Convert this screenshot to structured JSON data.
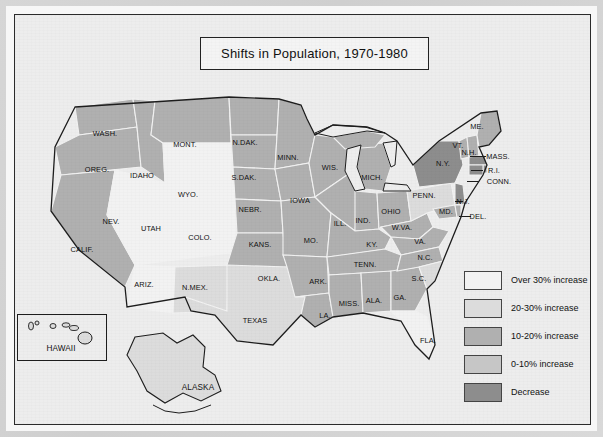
{
  "title": "Shifts in Population, 1970-1980",
  "legend": {
    "items": [
      {
        "label": "Over 30% increase",
        "color": "#f2f2f2"
      },
      {
        "label": "20-30% increase",
        "color": "#dcdcdc"
      },
      {
        "label": "10-20% increase",
        "color": "#b0b0b0"
      },
      {
        "label": "0-10% increase",
        "color": "#c6c6c6"
      },
      {
        "label": "Decrease",
        "color": "#8d8d8d"
      }
    ]
  },
  "insets": [
    {
      "name": "hawaii",
      "label": "HAWAII"
    },
    {
      "name": "alaska",
      "label": "ALASKA"
    }
  ],
  "states": [
    {
      "code": "WASH.",
      "label": "WASH.",
      "x": 90,
      "y": 118,
      "category": "10-20% increase"
    },
    {
      "code": "OREG.",
      "label": "OREG.",
      "x": 82,
      "y": 154,
      "category": "10-20% increase"
    },
    {
      "code": "IDAHO",
      "label": "IDAHO",
      "x": 127,
      "y": 160,
      "category": "10-20% increase"
    },
    {
      "code": "MONT.",
      "label": "MONT.",
      "x": 170,
      "y": 129,
      "category": "10-20% increase"
    },
    {
      "code": "WYO.",
      "label": "WYO.",
      "x": 173,
      "y": 179,
      "category": "Over 30% increase"
    },
    {
      "code": "NEV.",
      "label": "NEV.",
      "x": 96,
      "y": 206,
      "category": "Over 30% increase"
    },
    {
      "code": "UTAH",
      "label": "UTAH",
      "x": 136,
      "y": 213,
      "category": "Over 30% increase"
    },
    {
      "code": "COLO.",
      "label": "COLO.",
      "x": 185,
      "y": 222,
      "category": "Over 30% increase"
    },
    {
      "code": "CALIF.",
      "label": "CALIF.",
      "x": 67,
      "y": 234,
      "category": "10-20% increase"
    },
    {
      "code": "ARIZ.",
      "label": "ARIZ.",
      "x": 129,
      "y": 269,
      "category": "Over 30% increase"
    },
    {
      "code": "N.MEX.",
      "label": "N.MEX.",
      "x": 180,
      "y": 272,
      "category": "20-30% increase"
    },
    {
      "code": "N.DAK.",
      "label": "N.DAK.",
      "x": 230,
      "y": 127,
      "category": "0-10% increase"
    },
    {
      "code": "S.DAK.",
      "label": "S.DAK.",
      "x": 229,
      "y": 162,
      "category": "0-10% increase"
    },
    {
      "code": "NEBR.",
      "label": "NEBR.",
      "x": 235,
      "y": 194,
      "category": "0-10% increase"
    },
    {
      "code": "KANS.",
      "label": "KANS.",
      "x": 245,
      "y": 229,
      "category": "0-10% increase"
    },
    {
      "code": "OKLA.",
      "label": "OKLA.",
      "x": 254,
      "y": 263,
      "category": "10-20% increase"
    },
    {
      "code": "TEXAS",
      "label": "TEXAS",
      "x": 240,
      "y": 305,
      "category": "20-30% increase"
    },
    {
      "code": "MINN.",
      "label": "MINN.",
      "x": 273,
      "y": 142,
      "category": "0-10% increase"
    },
    {
      "code": "IOWA",
      "label": "IOWA",
      "x": 285,
      "y": 185,
      "category": "0-10% increase"
    },
    {
      "code": "MO.",
      "label": "MO.",
      "x": 296,
      "y": 225,
      "category": "0-10% increase"
    },
    {
      "code": "ARK.",
      "label": "ARK.",
      "x": 303,
      "y": 266,
      "category": "10-20% increase"
    },
    {
      "code": "LA.",
      "label": "LA.",
      "x": 310,
      "y": 300,
      "category": "10-20% increase"
    },
    {
      "code": "WIS.",
      "label": "WIS.",
      "x": 315,
      "y": 152,
      "category": "0-10% increase"
    },
    {
      "code": "ILL.",
      "label": "ILL.",
      "x": 325,
      "y": 208,
      "category": "0-10% increase"
    },
    {
      "code": "MISS.",
      "label": "MISS.",
      "x": 334,
      "y": 288,
      "category": "10-20% increase"
    },
    {
      "code": "IND.",
      "label": "IND.",
      "x": 348,
      "y": 205,
      "category": "0-10% increase"
    },
    {
      "code": "MICH.",
      "label": "MICH.",
      "x": 357,
      "y": 162,
      "category": "0-10% increase"
    },
    {
      "code": "KY.",
      "label": "KY.",
      "x": 357,
      "y": 229,
      "category": "0-10% increase"
    },
    {
      "code": "TENN.",
      "label": "TENN.",
      "x": 350,
      "y": 249,
      "category": "10-20% increase"
    },
    {
      "code": "ALA.",
      "label": "ALA.",
      "x": 359,
      "y": 285,
      "category": "10-20% increase"
    },
    {
      "code": "OHIO",
      "label": "OHIO",
      "x": 376,
      "y": 196,
      "category": "0-10% increase"
    },
    {
      "code": "GA.",
      "label": "GA.",
      "x": 385,
      "y": 282,
      "category": "10-20% increase"
    },
    {
      "code": "W.VA.",
      "label": "W.VA.",
      "x": 387,
      "y": 212,
      "category": "0-10% increase"
    },
    {
      "code": "PENN.",
      "label": "PENN.",
      "x": 409,
      "y": 180,
      "category": "20-30% increase"
    },
    {
      "code": "VA.",
      "label": "VA.",
      "x": 405,
      "y": 226,
      "category": "10-20% increase"
    },
    {
      "code": "N.C.",
      "label": "N.C.",
      "x": 410,
      "y": 242,
      "category": "10-20% increase"
    },
    {
      "code": "S.C.",
      "label": "S.C.",
      "x": 404,
      "y": 263,
      "category": "20-30% increase"
    },
    {
      "code": "FLA.",
      "label": "FLA.",
      "x": 413,
      "y": 325,
      "category": "Over 30% increase"
    },
    {
      "code": "N.Y.",
      "label": "N.Y.",
      "x": 428,
      "y": 148,
      "category": "Decrease"
    },
    {
      "code": "ME.",
      "label": "ME.",
      "x": 462,
      "y": 111,
      "category": "10-20% increase"
    },
    {
      "code": "VT.",
      "label": "VT.",
      "x": 443,
      "y": 130,
      "category": "10-20% increase"
    },
    {
      "code": "N.H.",
      "label": "N.H.",
      "x": 454,
      "y": 137,
      "category": "10-20% increase"
    },
    {
      "code": "MASS.",
      "label": "MASS.",
      "x": 483,
      "y": 141,
      "category": "Decrease"
    },
    {
      "code": "R.I.",
      "label": "R.I.",
      "x": 479,
      "y": 155,
      "category": "Decrease"
    },
    {
      "code": "CONN.",
      "label": "CONN.",
      "x": 484,
      "y": 166,
      "category": "Decrease"
    },
    {
      "code": "N.J.",
      "label": "N.J.",
      "x": 448,
      "y": 186,
      "category": "Decrease"
    },
    {
      "code": "MD.",
      "label": "MD.",
      "x": 431,
      "y": 196,
      "category": "0-10% increase"
    },
    {
      "code": "DEL.",
      "label": "DEL.",
      "x": 463,
      "y": 201,
      "category": "0-10% increase"
    }
  ]
}
